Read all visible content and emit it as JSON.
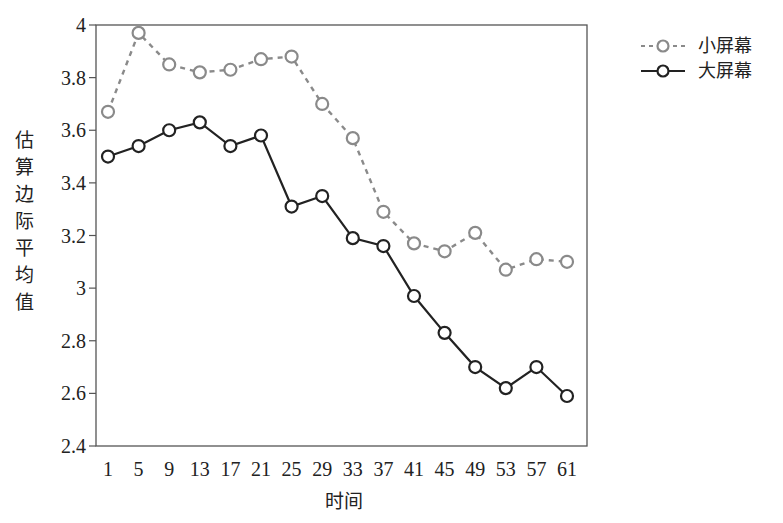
{
  "chart_data": {
    "type": "line",
    "title": "",
    "xlabel": "时间",
    "ylabel": "估算边际平均值",
    "x": [
      1,
      5,
      9,
      13,
      17,
      21,
      25,
      29,
      33,
      37,
      41,
      45,
      49,
      53,
      57,
      61
    ],
    "xticks": [
      "1",
      "5",
      "9",
      "13",
      "17",
      "21",
      "25",
      "29",
      "33",
      "37",
      "41",
      "45",
      "49",
      "53",
      "57",
      "61"
    ],
    "yticks": [
      "2.4",
      "2.6",
      "2.8",
      "3",
      "3.2",
      "3.4",
      "3.6",
      "3.8",
      "4"
    ],
    "ylim": [
      2.4,
      4.0
    ],
    "grid": false,
    "legend_position": "top-right-outside",
    "series": [
      {
        "name": "小屏幕",
        "style": "dashed",
        "color": "#8a8a8a",
        "marker": "open-circle",
        "values": [
          3.67,
          3.97,
          3.85,
          3.82,
          3.83,
          3.87,
          3.88,
          3.7,
          3.57,
          3.29,
          3.17,
          3.14,
          3.21,
          3.07,
          3.11,
          3.1
        ]
      },
      {
        "name": "大屏幕",
        "style": "solid",
        "color": "#222222",
        "marker": "open-circle",
        "values": [
          3.5,
          3.54,
          3.6,
          3.63,
          3.54,
          3.58,
          3.31,
          3.35,
          3.19,
          3.16,
          2.97,
          2.83,
          2.7,
          2.62,
          2.7,
          2.59
        ]
      }
    ]
  },
  "legend": {
    "items": [
      {
        "label": "小屏幕"
      },
      {
        "label": "大屏幕"
      }
    ]
  }
}
